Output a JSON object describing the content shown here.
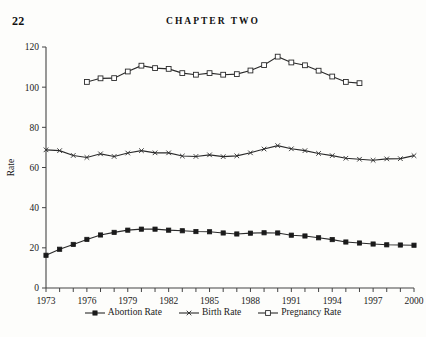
{
  "page": {
    "number": "22",
    "chapter_header": "CHAPTER TWO"
  },
  "legend": {
    "position": "bottom-center",
    "entries": [
      {
        "label": "Abortion Rate",
        "marker": "filled-square-icon",
        "color": "#1a1a1a"
      },
      {
        "label": "Birth Rate",
        "marker": "cross-marker-icon",
        "color": "#2a2a2a"
      },
      {
        "label": "Pregnancy Rate",
        "marker": "open-square-icon",
        "color": "#2a2a2a"
      }
    ]
  },
  "chart_data": {
    "type": "line",
    "title": "",
    "xlabel": "",
    "ylabel": "Rate",
    "xlim": [
      1973,
      2000
    ],
    "ylim": [
      0,
      120
    ],
    "ytick_labels": [
      "0",
      "20",
      "40",
      "60",
      "80",
      "100",
      "120"
    ],
    "yticks": [
      0,
      20,
      40,
      60,
      80,
      100,
      120
    ],
    "xtick_labels": [
      "1973",
      "1976",
      "1979",
      "1982",
      "1985",
      "1988",
      "1991",
      "1994",
      "1997",
      "2000"
    ],
    "xticks": [
      1973,
      1976,
      1979,
      1982,
      1985,
      1988,
      1991,
      1994,
      1997,
      2000
    ],
    "x_minor_ticks_every": 1,
    "grid": false,
    "series": [
      {
        "name": "Abortion Rate",
        "marker": "filled-square",
        "x": [
          1973,
          1974,
          1975,
          1976,
          1977,
          1978,
          1979,
          1980,
          1981,
          1982,
          1983,
          1984,
          1985,
          1986,
          1987,
          1988,
          1989,
          1990,
          1991,
          1992,
          1993,
          1994,
          1995,
          1996,
          1997,
          1998,
          1999,
          2000
        ],
        "values": [
          16.3,
          19.3,
          21.7,
          24.2,
          26.4,
          27.7,
          28.8,
          29.3,
          29.3,
          28.8,
          28.5,
          28.1,
          28.0,
          27.4,
          26.9,
          27.3,
          27.5,
          27.4,
          26.3,
          25.9,
          25.0,
          24.1,
          22.9,
          22.4,
          21.9,
          21.5,
          21.4,
          21.3
        ]
      },
      {
        "name": "Birth Rate",
        "marker": "cross",
        "x": [
          1973,
          1974,
          1975,
          1976,
          1977,
          1978,
          1979,
          1980,
          1981,
          1982,
          1983,
          1984,
          1985,
          1986,
          1987,
          1988,
          1989,
          1990,
          1991,
          1992,
          1993,
          1994,
          1995,
          1996,
          1997,
          1998,
          1999,
          2000
        ],
        "values": [
          68.8,
          68.4,
          66.0,
          65.0,
          66.8,
          65.5,
          67.2,
          68.4,
          67.3,
          67.3,
          65.7,
          65.5,
          66.3,
          65.4,
          65.8,
          67.3,
          69.2,
          70.9,
          69.3,
          68.4,
          67.0,
          65.9,
          64.6,
          64.1,
          63.6,
          64.3,
          64.4,
          65.9
        ]
      },
      {
        "name": "Pregnancy Rate",
        "marker": "open-square",
        "x": [
          1976,
          1977,
          1978,
          1979,
          1980,
          1981,
          1982,
          1983,
          1984,
          1985,
          1986,
          1987,
          1988,
          1989,
          1990,
          1991,
          1992,
          1993,
          1994,
          1995,
          1996
        ],
        "values": [
          102.6,
          104.4,
          104.5,
          107.8,
          110.7,
          109.5,
          109.1,
          107.0,
          106.2,
          107.0,
          106.2,
          106.5,
          108.3,
          111.0,
          115.2,
          112.3,
          110.9,
          108.2,
          105.3,
          102.6,
          102.0
        ]
      }
    ]
  }
}
